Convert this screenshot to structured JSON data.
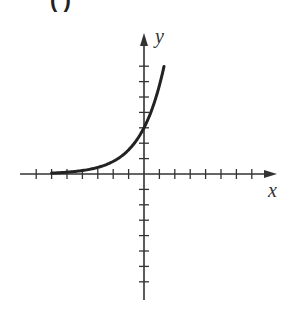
{
  "panel": {
    "label_note": "clipped bold panel label at top edge; letter not legible",
    "label_visible": "( )"
  },
  "colors": {
    "axis": "#333333",
    "curve": "#222222",
    "background": "#ffffff"
  },
  "chart_data": {
    "type": "line",
    "title": "",
    "xlabel": "x",
    "ylabel": "y",
    "xlim": [
      -8,
      8.5
    ],
    "ylim": [
      -8,
      9
    ],
    "x_ticks": [
      -7,
      -6,
      -5,
      -4,
      -3,
      -2,
      -1,
      1,
      2,
      3,
      4,
      5,
      6,
      7
    ],
    "y_ticks": [
      -7,
      -6,
      -5,
      -4,
      -3,
      -2,
      -1,
      1,
      2,
      3,
      4,
      5,
      6,
      7
    ],
    "tick_labels_shown": false,
    "grid": false,
    "series": [
      {
        "name": "exponential curve",
        "function": "y ≈ 3·e^(0.65x)",
        "y_intercept": 3,
        "x_range": [
          -6,
          1.3
        ],
        "points": [
          {
            "x": -6,
            "y": 0.06
          },
          {
            "x": -5,
            "y": 0.12
          },
          {
            "x": -4,
            "y": 0.22
          },
          {
            "x": -3,
            "y": 0.43
          },
          {
            "x": -2,
            "y": 0.82
          },
          {
            "x": -1,
            "y": 1.57
          },
          {
            "x": 0,
            "y": 3.0
          },
          {
            "x": 0.5,
            "y": 4.15
          },
          {
            "x": 1,
            "y": 5.75
          },
          {
            "x": 1.3,
            "y": 6.98
          }
        ]
      }
    ],
    "layout": {
      "origin_px": [
        144,
        174
      ],
      "unit_px": 15.4,
      "x_axis_px": [
        20,
        277
      ],
      "y_axis_px": [
        33,
        300
      ]
    }
  }
}
